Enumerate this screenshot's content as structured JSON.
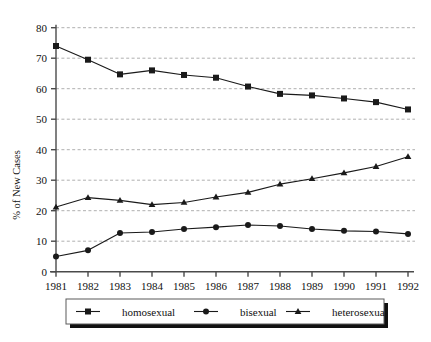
{
  "chart_data": {
    "type": "line",
    "title": "",
    "subtitle": "",
    "xlabel": "",
    "ylabel": "% of New Cases",
    "categories": [
      "1981",
      "1982",
      "1983",
      "1984",
      "1985",
      "1986",
      "1987",
      "1988",
      "1989",
      "1990",
      "1991",
      "1992"
    ],
    "x": [
      1981,
      1982,
      1983,
      1984,
      1985,
      1986,
      1987,
      1988,
      1989,
      1990,
      1991,
      1992
    ],
    "xlim": [
      1981,
      1992
    ],
    "ylim": [
      0,
      80
    ],
    "ytick_labels": [
      "0",
      "10",
      "20",
      "30",
      "40",
      "50",
      "60",
      "70",
      "80"
    ],
    "yticks": [
      0,
      10,
      20,
      30,
      40,
      50,
      60,
      70,
      80
    ],
    "grid": "horizontal-dashed",
    "legend_position": "below-center",
    "series": [
      {
        "name": "homosexual",
        "marker": "square",
        "values": [
          74.0,
          69.5,
          64.7,
          66.0,
          64.5,
          63.6,
          60.7,
          58.3,
          57.8,
          56.8,
          55.6,
          53.2
        ]
      },
      {
        "name": "bisexual",
        "marker": "circle",
        "values": [
          5.0,
          7.0,
          12.7,
          13.0,
          14.0,
          14.6,
          15.3,
          15.0,
          14.0,
          13.4,
          13.2,
          12.4
        ]
      },
      {
        "name": "heterosexual",
        "marker": "triangle",
        "values": [
          21.2,
          24.3,
          23.4,
          22.0,
          22.7,
          24.5,
          26.0,
          28.7,
          30.5,
          32.4,
          34.5,
          37.7
        ]
      }
    ]
  },
  "legend": {
    "items": [
      {
        "label": "homosexual"
      },
      {
        "label": "bisexual"
      },
      {
        "label": "heterosexual"
      }
    ]
  },
  "colors": {
    "line": "#1a1a1a",
    "grid": "#9a9a9a",
    "axis": "#4a4a4a",
    "background": "#ffffff",
    "legend_border": "#5a5a5a",
    "legend_shadow": "#111111"
  }
}
